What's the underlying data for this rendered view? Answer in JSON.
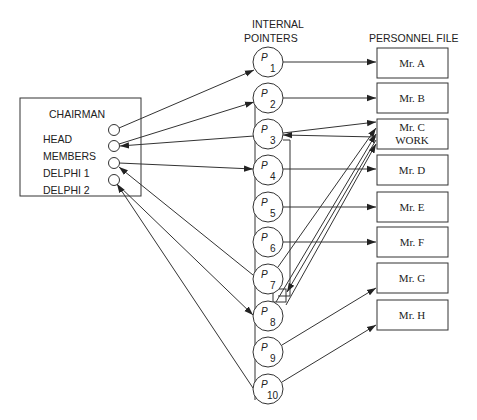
{
  "headers": {
    "pointers_line1": "INTERNAL",
    "pointers_line2": "POINTERS",
    "personnel": "PERSONNEL FILE"
  },
  "chairman": {
    "title": "CHAIRMAN",
    "fields": [
      "HEAD",
      "MEMBERS",
      "DELPHI 1",
      "DELPHI 2"
    ]
  },
  "pointers": [
    {
      "letter": "P",
      "sub": "1"
    },
    {
      "letter": "P",
      "sub": "2"
    },
    {
      "letter": "P",
      "sub": "3"
    },
    {
      "letter": "P",
      "sub": "4"
    },
    {
      "letter": "P",
      "sub": "5"
    },
    {
      "letter": "P",
      "sub": "6"
    },
    {
      "letter": "P",
      "sub": "7"
    },
    {
      "letter": "P",
      "sub": "8"
    },
    {
      "letter": "P",
      "sub": "9"
    },
    {
      "letter": "P",
      "sub": "10"
    }
  ],
  "personnel": [
    {
      "line1": "Mr. A"
    },
    {
      "line1": "Mr. B"
    },
    {
      "line1": "Mr. C",
      "line2": "WORK"
    },
    {
      "line1": "Mr. D"
    },
    {
      "line1": "Mr. E"
    },
    {
      "line1": "Mr. F"
    },
    {
      "line1": "Mr. G"
    },
    {
      "line1": "Mr. H"
    }
  ]
}
